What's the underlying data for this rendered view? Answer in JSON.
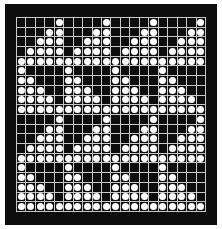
{
  "figure": {
    "rows": 20,
    "cols": 20,
    "colors": {
      "background": "#0d0d0d",
      "grid_line": "#c8c8c8",
      "dot": "#ffffff",
      "margin": "#ffffff"
    },
    "pattern": [
      "00001000010000100001",
      "00011000110001100011",
      "00111001110011100111",
      "01111011110111101111",
      "11111111111111111111",
      "10000100001000010000",
      "11000110001100011000",
      "11100111001110011100",
      "11110111101111011110",
      "11111111111111111111",
      "00001000010000100001",
      "00011000110001100011",
      "00111001110011100111",
      "01111011110111101111",
      "11111111111111111111",
      "10000100001000010000",
      "11000110001100011000",
      "11100111001110011100",
      "11110111101111011110",
      "11111111111111111111"
    ]
  }
}
